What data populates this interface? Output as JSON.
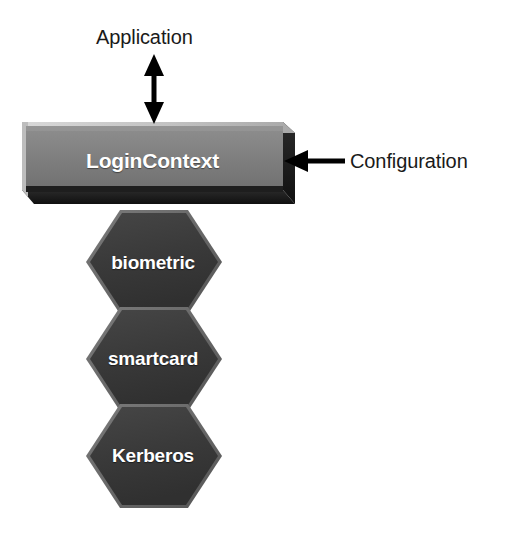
{
  "diagram": {
    "background_color": "#ffffff",
    "box": {
      "label": "LoginContext",
      "face_color": "#808080",
      "top_bevel_color": "#c9c9c9",
      "side_bevel_color": "#1c1c1c",
      "text_color": "#ffffff"
    },
    "modules": [
      {
        "label": "biometric",
        "fill_color": "#3a3a3a",
        "text_color": "#ffffff"
      },
      {
        "label": "smartcard",
        "fill_color": "#3a3a3a",
        "text_color": "#ffffff"
      },
      {
        "label": "Kerberos",
        "fill_color": "#3a3a3a",
        "text_color": "#ffffff"
      }
    ],
    "annotations": [
      {
        "label": "Application",
        "arrow": "double-headed-vertical",
        "arrow_color": "#000000",
        "points_to": "LoginContext"
      },
      {
        "label": "Configuration",
        "arrow": "single-headed-left",
        "arrow_color": "#000000",
        "points_to": "LoginContext"
      }
    ]
  }
}
